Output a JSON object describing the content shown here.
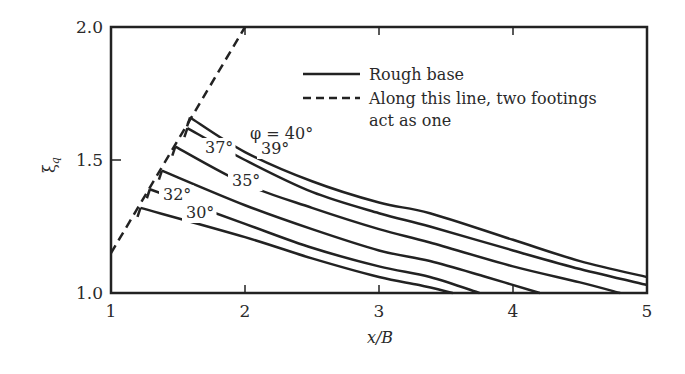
{
  "chart_data": {
    "type": "line",
    "title": "",
    "xlabel": "x/B",
    "ylabel": "ξq",
    "xlim": [
      1,
      5
    ],
    "ylim": [
      1.0,
      2.0
    ],
    "xticks": [
      "1",
      "2",
      "3",
      "4",
      "5"
    ],
    "yticks": [
      "1.0",
      "1.5",
      "2.0"
    ],
    "grid": false,
    "legend": {
      "position": "upper-right-inside",
      "entries": [
        {
          "style": "solid",
          "label": "Rough base"
        },
        {
          "style": "dashed",
          "label_line1": "Along this line, two footings",
          "label_line2": "act as one"
        }
      ]
    },
    "series": [
      {
        "name": "φ = 40°",
        "label": "φ = 40°",
        "points": [
          [
            1.59,
            1.66
          ],
          [
            2.0,
            1.53
          ],
          [
            2.5,
            1.42
          ],
          [
            3.0,
            1.34
          ],
          [
            3.38,
            1.3
          ],
          [
            4.0,
            1.2
          ],
          [
            4.5,
            1.12
          ],
          [
            5.0,
            1.06
          ]
        ]
      },
      {
        "name": "39°",
        "label": "39°",
        "points": [
          [
            1.57,
            1.62
          ],
          [
            2.0,
            1.5
          ],
          [
            2.5,
            1.38
          ],
          [
            3.0,
            1.3
          ],
          [
            3.38,
            1.25
          ],
          [
            4.0,
            1.16
          ],
          [
            4.5,
            1.09
          ],
          [
            5.0,
            1.03
          ]
        ]
      },
      {
        "name": "37°",
        "label": "37°",
        "points": [
          [
            1.48,
            1.55
          ],
          [
            2.0,
            1.41
          ],
          [
            2.5,
            1.32
          ],
          [
            3.0,
            1.24
          ],
          [
            3.38,
            1.19
          ],
          [
            4.0,
            1.1
          ],
          [
            4.5,
            1.04
          ],
          [
            4.8,
            1.0
          ]
        ]
      },
      {
        "name": "35°",
        "label": "35°",
        "points": [
          [
            1.38,
            1.46
          ],
          [
            2.0,
            1.33
          ],
          [
            2.5,
            1.24
          ],
          [
            3.0,
            1.16
          ],
          [
            3.38,
            1.12
          ],
          [
            3.8,
            1.06
          ],
          [
            4.2,
            1.0
          ]
        ]
      },
      {
        "name": "32°",
        "label": "32°",
        "points": [
          [
            1.29,
            1.39
          ],
          [
            2.0,
            1.26
          ],
          [
            2.5,
            1.17
          ],
          [
            3.0,
            1.1
          ],
          [
            3.38,
            1.06
          ],
          [
            3.75,
            1.0
          ]
        ]
      },
      {
        "name": "30°",
        "label": "30°",
        "points": [
          [
            1.22,
            1.32
          ],
          [
            2.0,
            1.21
          ],
          [
            2.5,
            1.13
          ],
          [
            3.0,
            1.06
          ],
          [
            3.3,
            1.03
          ],
          [
            3.55,
            1.0
          ]
        ]
      },
      {
        "name": "two footings act as one",
        "style": "dashed",
        "points": [
          [
            1.0,
            1.15
          ],
          [
            2.0,
            2.0
          ]
        ]
      }
    ]
  },
  "ui": {
    "xlabel": "x/B",
    "ylabel_main": "ξ",
    "ylabel_sub": "q",
    "legend_solid": "Rough base",
    "legend_dashed_1": "Along this line, two footings",
    "legend_dashed_2": "act as one",
    "curve_labels": [
      "φ = 40°",
      "39°",
      "37°",
      "35°",
      "32°",
      "30°"
    ]
  }
}
